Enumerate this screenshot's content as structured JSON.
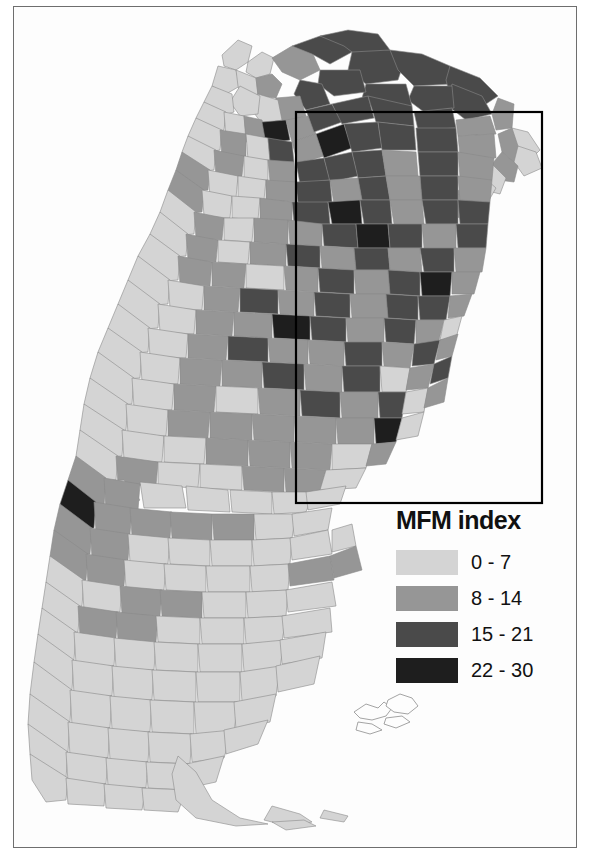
{
  "figure": {
    "kind": "choropleth-map",
    "region": "Argentina",
    "subdivision": "departments",
    "background_color": "#fdfdfd",
    "frame_color": "#6e6e6e"
  },
  "legend": {
    "title": "MFM index",
    "position": "lower-right",
    "classes": [
      {
        "label": "0 - 7",
        "color": "#d4d4d4"
      },
      {
        "label": "8 - 14",
        "color": "#969696"
      },
      {
        "label": "15 - 21",
        "color": "#4a4a4a"
      },
      {
        "label": "22 - 30",
        "color": "#1e1e1e"
      }
    ]
  },
  "inset_box": {
    "name": "study-area-rectangle",
    "stroke": "#000000",
    "x": 296,
    "y": 112,
    "width": 246,
    "height": 391
  },
  "chart_data": {
    "type": "map",
    "title": "MFM index",
    "variable": "MFM index",
    "value_bins": [
      [
        0,
        7
      ],
      [
        8,
        14
      ],
      [
        15,
        21
      ],
      [
        22,
        30
      ]
    ],
    "bin_colors": [
      "#d4d4d4",
      "#969696",
      "#4a4a4a",
      "#1e1e1e"
    ],
    "legend_position": "lower-right",
    "grid": false,
    "annotations": [
      "study-area rectangle over north-east / Pampas region"
    ],
    "regional_summary": [
      {
        "region": "Patagonia (south)",
        "dominant_bin": "0 - 7"
      },
      {
        "region": "Tierra del Fuego",
        "dominant_bin": "0 - 7"
      },
      {
        "region": "Cuyo / Andes west",
        "dominant_bin": "0 - 7"
      },
      {
        "region": "Northwest (Jujuy, Salta)",
        "dominant_bin": "8 - 14"
      },
      {
        "region": "Chaco / Formosa north",
        "dominant_bin": "15 - 21"
      },
      {
        "region": "Santiago del Estero",
        "dominant_bin": "15 - 21"
      },
      {
        "region": "Corrientes / Misiones",
        "dominant_bin": "8 - 14"
      },
      {
        "region": "Buenos Aires province",
        "dominant_bin": "8 - 14"
      },
      {
        "region": "Santa Fe / Entre Rios",
        "dominant_bin": "15 - 21"
      }
    ]
  }
}
